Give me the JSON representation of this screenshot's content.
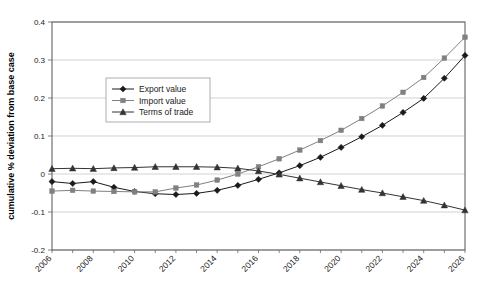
{
  "chart_data": {
    "type": "line",
    "title": "",
    "xlabel": "",
    "ylabel": "cumulative % deviation from base case",
    "ylim": [
      -0.2,
      0.4
    ],
    "yticks": [
      "0.4",
      "0.3",
      "0.2",
      "0.1",
      "0",
      "-0.1",
      "-0.2"
    ],
    "ytick_values": [
      0.4,
      0.3,
      0.2,
      0.1,
      0,
      -0.1,
      -0.2
    ],
    "grid": true,
    "legend_position": "upper-left-inside",
    "x": [
      2006,
      2007,
      2008,
      2009,
      2010,
      2011,
      2012,
      2013,
      2014,
      2015,
      2016,
      2017,
      2018,
      2019,
      2020,
      2021,
      2022,
      2023,
      2024,
      2025,
      2026
    ],
    "xtick_labels": [
      "2006",
      "2008",
      "2010",
      "2012",
      "2014",
      "2016",
      "2018",
      "2020",
      "2022",
      "2024",
      "2026"
    ],
    "xlim": [
      2006,
      2026
    ],
    "series": [
      {
        "name": "Export value",
        "marker": "diamond",
        "color": "#1a1a1a",
        "values": [
          -0.02,
          -0.025,
          -0.02,
          -0.035,
          -0.046,
          -0.052,
          -0.054,
          -0.051,
          -0.043,
          -0.03,
          -0.014,
          0.003,
          0.022,
          0.044,
          0.07,
          0.098,
          0.128,
          0.162,
          0.199,
          0.252,
          0.312
        ]
      },
      {
        "name": "Import value",
        "marker": "square",
        "color": "#808080",
        "values": [
          -0.045,
          -0.043,
          -0.045,
          -0.046,
          -0.047,
          -0.047,
          -0.037,
          -0.029,
          -0.016,
          0.0,
          0.019,
          0.04,
          0.063,
          0.088,
          0.115,
          0.146,
          0.179,
          0.215,
          0.254,
          0.305,
          0.36
        ]
      },
      {
        "name": "Terms of trade",
        "marker": "triangle",
        "color": "#333333",
        "values": [
          0.014,
          0.015,
          0.014,
          0.016,
          0.017,
          0.019,
          0.019,
          0.019,
          0.018,
          0.015,
          0.008,
          -0.001,
          -0.011,
          -0.021,
          -0.031,
          -0.041,
          -0.05,
          -0.06,
          -0.07,
          -0.082,
          -0.095
        ]
      }
    ]
  }
}
